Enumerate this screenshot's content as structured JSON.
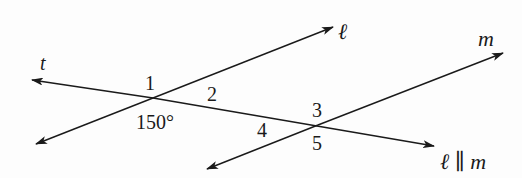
{
  "diagram": {
    "lines": [
      {
        "name": "t",
        "label": "t",
        "role": "transversal"
      },
      {
        "name": "l",
        "label": "ℓ",
        "role": "parallel line"
      },
      {
        "name": "m",
        "label": "m",
        "role": "parallel line"
      }
    ],
    "angle_labels": {
      "a1": "1",
      "a2": "2",
      "a150": "150°",
      "a3": "3",
      "a4": "4",
      "a5": "5"
    },
    "line_labels": {
      "t": "t",
      "l": "ℓ",
      "m": "m",
      "parallel_statement": "ℓ ∥ m"
    },
    "colors": {
      "stroke": "#1a1a1a",
      "background": "#fdfdfd"
    }
  }
}
